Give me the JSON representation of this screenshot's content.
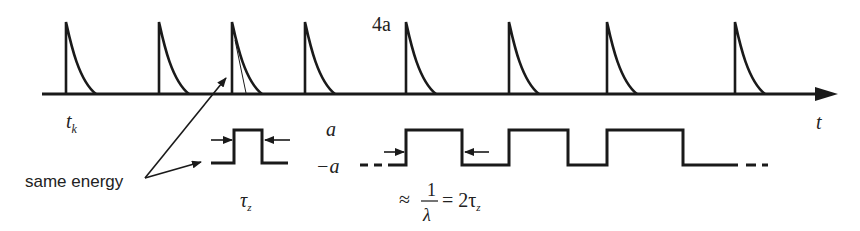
{
  "diagram": {
    "axis": {
      "label": "t",
      "y": 94,
      "x_start": 42,
      "x_end": 838
    },
    "impulses": {
      "amplitude_label": "4a",
      "start_label": "t",
      "start_label_sub": "k",
      "positions": [
        66,
        159,
        232,
        305,
        406,
        509,
        607,
        735
      ]
    },
    "small_pulse": {
      "high_label": "a",
      "low_label": "−a",
      "width_label": "τ",
      "width_label_sub": "z"
    },
    "square_wave": {
      "period_label_prefix": "≈",
      "period_fraction_num": "1",
      "period_fraction_den": "λ",
      "period_label_suffix": "= 2τ",
      "period_label_sub": "z",
      "edges": [
        406,
        462,
        509,
        568,
        607,
        683
      ]
    },
    "annotation": {
      "text": "same energy"
    },
    "colors": {
      "ink": "#1a1a1a",
      "background": "#ffffff"
    }
  }
}
